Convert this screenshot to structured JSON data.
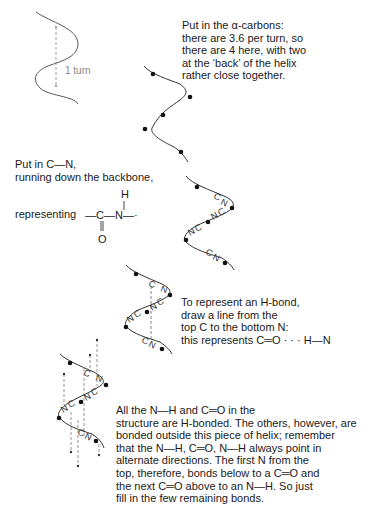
{
  "step1": {
    "turn_label": "1 turn",
    "lines": [
      "Put in the α-carbons:",
      "there are 3.6 per turn, so",
      "there are 4 here, with two",
      "at the ‘back’ of the helix",
      "rather close together."
    ]
  },
  "step2": {
    "lines": [
      "Put in C—N,",
      "running down the backbone,"
    ],
    "representing_label": "representing",
    "formula": {
      "left_bond": "—C—N—·",
      "atom_C": "C",
      "atom_N": "N",
      "atom_H": "H",
      "atom_O": "O"
    },
    "helix_labels": [
      "CN",
      "NC",
      "NC",
      "CN"
    ]
  },
  "step3": {
    "lines": [
      "To represent an H-bond,",
      "draw a line from the",
      "top C to the bottom N:",
      "this represents C═O · · · H—N"
    ],
    "helix_labels": [
      "C",
      "N",
      "NC",
      "NC",
      "CN"
    ]
  },
  "step4": {
    "lines": [
      "All the N—H and C═O in the",
      "structure are H-bonded. The others, however, are",
      "bonded outside this piece of helix; remember",
      "that the N—H, C═O, N—H always point in",
      "alternate directions. The first N from the",
      "top, therefore, bonds below to a C═O and",
      "the next C═O above to an N—H. So just",
      "fill in the few remaining bonds."
    ],
    "helix_labels": [
      "C",
      "N",
      "NC",
      "NC",
      "CN"
    ]
  }
}
